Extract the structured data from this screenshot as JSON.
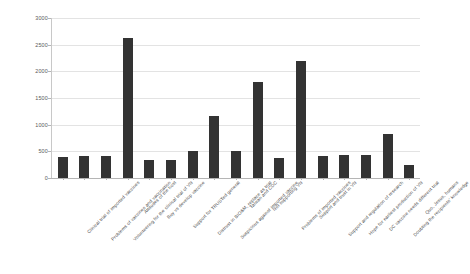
{
  "chart_data": {
    "type": "bar",
    "title": "",
    "xlabel": "",
    "ylabel": "",
    "ylim": [
      0,
      3000
    ],
    "grid": true,
    "legend": false,
    "bar_color": "#333333",
    "gridline_color": "#e3e3e3",
    "yticks": [
      0,
      500,
      1000,
      1500,
      2000,
      2500,
      3000
    ],
    "ytick_labels": [
      "0",
      "500",
      "1000",
      "1500",
      "2000",
      "2500",
      "3000"
    ],
    "categories": [
      "Clinical trial of imported vaccines",
      "Problems of vaccines and vaccination",
      "Volunteering for the clinical trial of VN",
      "Attitudes of the host",
      "Buy vs develop vaccine",
      "Support for TRUSTed general",
      "Distrust in BIO&M, replace as trial",
      "Suspicious against imported vaccine",
      "Taiwan and CDC",
      "Not supporting VN",
      "Problems of imported vaccines",
      "Support and trust in VN",
      "Support and regulation of research",
      "Hope for earliest production of VN",
      "DC vaccine needs different trial",
      "Doubting the recipients' knowledge",
      "Quo, Jesus, humans"
    ],
    "values": [
      400,
      420,
      420,
      2620,
      340,
      340,
      500,
      1170,
      500,
      1800,
      380,
      2200,
      420,
      430,
      430,
      830,
      250
    ]
  }
}
